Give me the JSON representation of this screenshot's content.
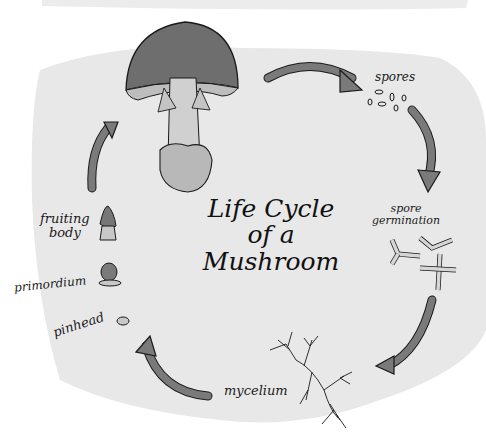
{
  "title": {
    "line1": "Life Cycle",
    "line2": "of a Mushroom"
  },
  "stages": [
    {
      "id": "mature-mushroom",
      "label": ""
    },
    {
      "id": "spores",
      "label": "spores"
    },
    {
      "id": "spore-germination",
      "label_line1": "spore",
      "label_line2": "germination"
    },
    {
      "id": "mycelium",
      "label": "mycelium"
    },
    {
      "id": "pinhead",
      "label": "pinhead"
    },
    {
      "id": "primordium",
      "label": "primordium"
    },
    {
      "id": "fruiting-body",
      "label_line1": "fruiting",
      "label_line2": "body"
    }
  ],
  "colors": {
    "background_blob": "#e9e9e9",
    "arrow_fill": "#7a7a7a",
    "cap_fill": "#6e6e6e",
    "stem_fill": "#c9c9c9",
    "ink": "#1a1a1a"
  }
}
